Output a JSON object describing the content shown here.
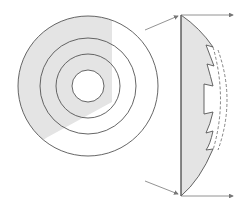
{
  "diagram": {
    "title": "",
    "colors": {
      "stroke": "#555555",
      "shade": "#e4e4e4",
      "arrow": "#777777",
      "background": "#ffffff"
    },
    "front_view": {
      "center": [
        88,
        86
      ],
      "ring_radii": [
        70,
        48,
        32,
        16
      ]
    },
    "side_view": {
      "flat_edge_x": 181,
      "top_y": 15,
      "bottom_y": 196
    },
    "labels": []
  }
}
